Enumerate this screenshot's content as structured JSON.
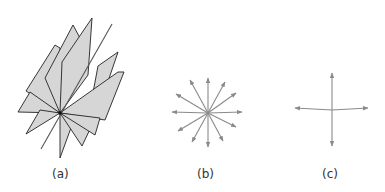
{
  "figure": {
    "panels": [
      {
        "id": "a",
        "label": "(a)",
        "description": "Pencil of planes through a common point",
        "center": [
          60,
          113
        ],
        "plane_fill": "#d6d6d6",
        "edge_color": "#222222"
      },
      {
        "id": "b",
        "label": "(b)",
        "description": "Radial star of arrows from a point (many directions)",
        "center": [
          208,
          113
        ],
        "arrow_count": 12,
        "arrow_color": "#8a8a8a"
      },
      {
        "id": "c",
        "label": "(c)",
        "description": "Four arrows along two perpendicular axes",
        "center": [
          332,
          110
        ],
        "arrow_count": 4,
        "arrow_color": "#8a8a8a"
      }
    ]
  }
}
